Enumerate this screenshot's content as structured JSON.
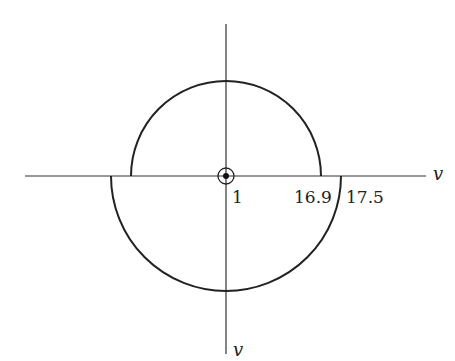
{
  "diagram": {
    "axes": {
      "horizontal_label": "v",
      "vertical_label": "v"
    },
    "origin_marker": "circled-dot",
    "tick_labels": {
      "origin": "1",
      "inner_radius": "16.9",
      "outer_radius": "17.5"
    },
    "shapes": [
      {
        "type": "upper-semicircle",
        "radius_label": "16.9"
      },
      {
        "type": "lower-semicircle",
        "radius_label": "17.5"
      }
    ],
    "stroke_color": "#222222"
  }
}
